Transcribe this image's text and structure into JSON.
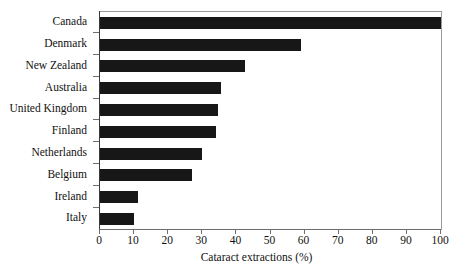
{
  "chart_data": {
    "type": "bar",
    "orientation": "horizontal",
    "title": "",
    "xlabel": "Cataract extractions (%)",
    "ylabel": "",
    "categories": [
      "Canada",
      "Denmark",
      "New Zealand",
      "Australia",
      "United Kingdom",
      "Finland",
      "Netherlands",
      "Belgium",
      "Ireland",
      "Italy"
    ],
    "values": [
      100,
      59,
      42.5,
      35.5,
      34.5,
      34,
      30,
      27,
      11,
      10
    ],
    "xlim": [
      0,
      100
    ],
    "xticks": [
      0,
      10,
      20,
      30,
      40,
      50,
      60,
      70,
      80,
      90,
      100
    ],
    "xtick_labels": [
      "0",
      "10",
      "20",
      "30",
      "40",
      "50",
      "60",
      "70",
      "80",
      "90",
      "100"
    ],
    "grid": false,
    "legend": null,
    "bar_color": "#171717",
    "axis_color": "#6e6e6e",
    "background": "#ffffff"
  }
}
